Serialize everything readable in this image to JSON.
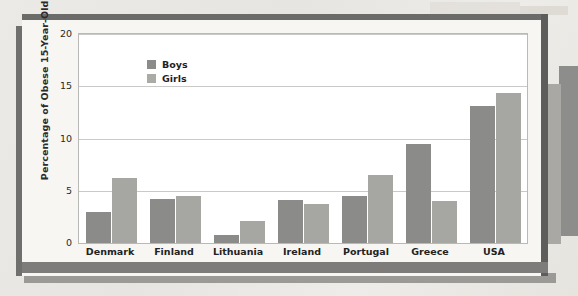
{
  "chart_data": {
    "type": "bar",
    "title": "",
    "xlabel": "",
    "ylabel": "Percentage of Obese 15-Year-Olds",
    "ylim": [
      0,
      20
    ],
    "yticks": [
      0,
      5,
      10,
      15,
      20
    ],
    "grid": true,
    "legend_position": "top-left",
    "categories": [
      "Denmark",
      "Finland",
      "Lithuania",
      "Ireland",
      "Portugal",
      "Greece",
      "USA"
    ],
    "series": [
      {
        "name": "Boys",
        "color": "#8b8b89",
        "values": [
          3.0,
          4.2,
          0.8,
          4.1,
          4.5,
          9.5,
          13.1
        ]
      },
      {
        "name": "Girls",
        "color": "#a6a6a3",
        "values": [
          6.2,
          4.5,
          2.1,
          3.7,
          6.5,
          4.0,
          14.4
        ]
      }
    ]
  }
}
